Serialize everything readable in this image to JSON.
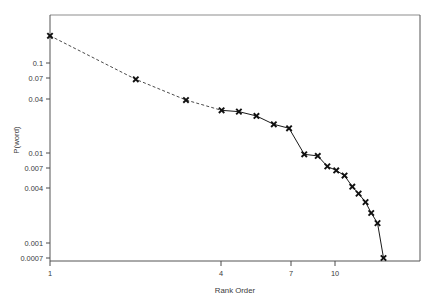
{
  "chart_data": {
    "type": "line",
    "title": "",
    "subtitle": "",
    "xlabel": "Rank Order",
    "ylabel": "P(word)",
    "xscale": "log",
    "yscale": "log",
    "xlim": [
      1,
      16
    ],
    "ylim": [
      0.0007,
      0.25
    ],
    "grid": false,
    "legend": null,
    "xticks": [
      1,
      4,
      7,
      10
    ],
    "xtick_labels": [
      "1",
      "4",
      "7",
      "10"
    ],
    "yticks": [
      0.1,
      0.07,
      0.04,
      0.01,
      0.007,
      0.004,
      0.001,
      0.0007
    ],
    "ytick_labels": [
      "0.1",
      "0.07",
      "0.04",
      "0.01",
      "0.007",
      "0.004",
      "0.001",
      "0.0007"
    ],
    "marker": "x",
    "series": [
      {
        "name": "P(word) vs rank",
        "x": [
          1,
          2,
          3,
          4,
          4.6,
          5.3,
          6.1,
          6.9,
          7.8,
          8.7,
          9.4,
          10.1,
          10.8,
          11.5,
          12.1,
          12.8,
          13.4,
          14.1,
          14.8
        ],
        "values": [
          0.2,
          0.066,
          0.039,
          0.03,
          0.029,
          0.026,
          0.021,
          0.019,
          0.0098,
          0.0094,
          0.0072,
          0.0065,
          0.0057,
          0.0043,
          0.0036,
          0.0029,
          0.0022,
          0.0017,
          0.0007
        ]
      }
    ],
    "annotations": []
  },
  "axes": {
    "x_title": "Rank Order",
    "y_title": "P(word)"
  }
}
